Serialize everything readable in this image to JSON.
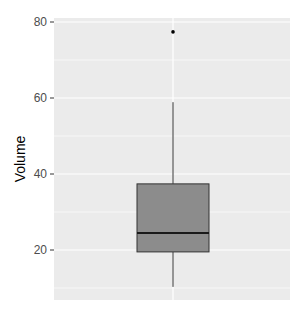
{
  "chart_data": {
    "type": "boxplot",
    "title": "",
    "xlabel": "",
    "ylabel": "Volume",
    "ylim": [
      7.5,
      80.5
    ],
    "yticks": [
      20,
      40,
      60,
      80
    ],
    "ytick_labels": [
      "20",
      "40",
      "60",
      "80"
    ],
    "minor_gridlines": [
      10,
      30,
      50,
      70
    ],
    "grid": true,
    "legend": null,
    "categories": [
      ""
    ],
    "series": [
      {
        "name": "Volume",
        "whisker_low": 10.3,
        "q1": 19.5,
        "median": 24.5,
        "q3": 37.4,
        "whisker_high": 58.9,
        "outliers": [
          77.4
        ]
      }
    ],
    "colors": {
      "panel_background": "#ebebeb",
      "gridline": "#ffffff",
      "box_fill": "#8c8c8c",
      "box_stroke": "#333333",
      "outlier": "#000000"
    }
  }
}
